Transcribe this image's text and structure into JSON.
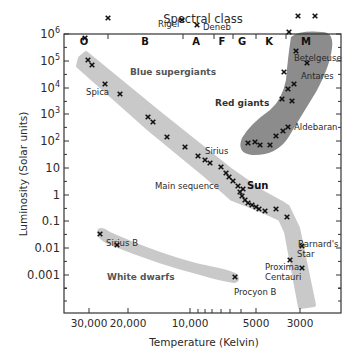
{
  "chart_data": {
    "type": "scatter",
    "title": "Spectral class",
    "xlabel": "Temperature (Kelvin)",
    "ylabel": "Luminosity (Solar units)",
    "x_scale": "log, reversed",
    "y_scale": "log",
    "x_tick_labels": [
      "30,000",
      "20,000",
      "10,000",
      "5000",
      "3000"
    ],
    "y_tick_labels": [
      "10^6",
      "10^5",
      "10^4",
      "10^3",
      "10^2",
      "10",
      "1",
      "0.1",
      "0.01",
      "0.001"
    ],
    "ylim": [
      0.0001,
      1000000
    ],
    "spectral_classes": [
      "O",
      "B",
      "A",
      "F",
      "G",
      "K",
      "M"
    ],
    "regions": [
      {
        "name": "Blue supergiants"
      },
      {
        "name": "Red giants"
      },
      {
        "name": "Main sequence"
      },
      {
        "name": "White dwarfs"
      }
    ],
    "labeled_stars": [
      {
        "name": "Rigel",
        "temperature": 11000,
        "luminosity": 200000
      },
      {
        "name": "Deneb",
        "temperature": 9000,
        "luminosity": 150000
      },
      {
        "name": "Betelgeuse",
        "temperature": 3500,
        "luminosity": 100000
      },
      {
        "name": "Antares",
        "temperature": 3300,
        "luminosity": 40000
      },
      {
        "name": "Spica",
        "temperature": 22000,
        "luminosity": 13000
      },
      {
        "name": "Aldebaran",
        "temperature": 4000,
        "luminosity": 150
      },
      {
        "name": "Sirius",
        "temperature": 9500,
        "luminosity": 25
      },
      {
        "name": "Sun",
        "temperature": 5800,
        "luminosity": 1
      },
      {
        "name": "Sirius B",
        "temperature": 25000,
        "luminosity": 0.03
      },
      {
        "name": "Procyon B",
        "temperature": 7000,
        "luminosity": 0.0007
      },
      {
        "name": "Barnard's Star",
        "temperature": 3200,
        "luminosity": 0.004
      },
      {
        "name": "Proxima Centauri",
        "temperature": 3000,
        "luminosity": 0.0017
      }
    ]
  },
  "header": {
    "title": "Spectral class"
  },
  "axes": {
    "xlabel": "Temperature (Kelvin)",
    "ylabel": "Luminosity (Solar units)",
    "x_ticks": [
      {
        "label": "30,000",
        "x": 89
      },
      {
        "label": "20,000",
        "x": 128
      },
      {
        "label": "10,000",
        "x": 190
      },
      {
        "label": "5000",
        "x": 256
      },
      {
        "label": "3000",
        "x": 300
      }
    ],
    "y_ticks": [
      {
        "base": "10",
        "exp": "6",
        "y": 34
      },
      {
        "base": "10",
        "exp": "5",
        "y": 61
      },
      {
        "base": "10",
        "exp": "4",
        "y": 88
      },
      {
        "base": "10",
        "exp": "3",
        "y": 114
      },
      {
        "base": "10",
        "exp": "2",
        "y": 141
      },
      {
        "label": "10",
        "y": 168
      },
      {
        "label": "1",
        "y": 195
      },
      {
        "label": "0.1",
        "y": 221
      },
      {
        "label": "0.01",
        "y": 248
      },
      {
        "label": "0.001",
        "y": 275
      }
    ]
  },
  "classes": [
    {
      "label": "O",
      "x": 84
    },
    {
      "label": "B",
      "x": 145
    },
    {
      "label": "A",
      "x": 196
    },
    {
      "label": "F",
      "x": 222
    },
    {
      "label": "G",
      "x": 242
    },
    {
      "label": "K",
      "x": 269
    },
    {
      "label": "M",
      "x": 306
    }
  ],
  "regions": {
    "blue_supergiants": "Blue supergiants",
    "red_giants": "Red giants",
    "main_sequence": "Main sequence",
    "white_dwarfs": "White dwarfs"
  },
  "stars": {
    "rigel": "Rigel",
    "deneb": "Deneb",
    "betelgeuse": "Betelgeuse",
    "antares": "Antares",
    "spica": "Spica",
    "aldebaran": "Aldebaran",
    "sirius": "Sirius",
    "sun": "Sun",
    "sirius_b": "Sirius B",
    "procyon_b": "Procyon B",
    "barnards_1": "Barnard's",
    "barnards_2": "Star",
    "proxima_1": "Proxima",
    "proxima_2": "Centauri"
  },
  "markers": [
    [
      85,
      38
    ],
    [
      108,
      18
    ],
    [
      88,
      60
    ],
    [
      92,
      65
    ],
    [
      105,
      84
    ],
    [
      120,
      94
    ],
    [
      148,
      117
    ],
    [
      153,
      122
    ],
    [
      167,
      137
    ],
    [
      185,
      147
    ],
    [
      198,
      156
    ],
    [
      205,
      160
    ],
    [
      210,
      163
    ],
    [
      221,
      167
    ],
    [
      226,
      173
    ],
    [
      229,
      177
    ],
    [
      233,
      181
    ],
    [
      238,
      186
    ],
    [
      243,
      189
    ],
    [
      240,
      192
    ],
    [
      242,
      196
    ],
    [
      245,
      200
    ],
    [
      248,
      203
    ],
    [
      252,
      205
    ],
    [
      256,
      207
    ],
    [
      259,
      209
    ],
    [
      265,
      211
    ],
    [
      276,
      209
    ],
    [
      287,
      217
    ],
    [
      182,
      20
    ],
    [
      197,
      25
    ],
    [
      298,
      16
    ],
    [
      315,
      16
    ],
    [
      289,
      32
    ],
    [
      296,
      51
    ],
    [
      307,
      63
    ],
    [
      284,
      72
    ],
    [
      282,
      99
    ],
    [
      288,
      89
    ],
    [
      294,
      84
    ],
    [
      292,
      101
    ],
    [
      248,
      143
    ],
    [
      255,
      142
    ],
    [
      260,
      145
    ],
    [
      270,
      145
    ],
    [
      276,
      136
    ],
    [
      283,
      131
    ],
    [
      288,
      127
    ],
    [
      290,
      260
    ],
    [
      302,
      268
    ],
    [
      302,
      246
    ],
    [
      100,
      234
    ],
    [
      117,
      245
    ],
    [
      235,
      277
    ]
  ],
  "colors": {
    "band": "#c8c8c8",
    "giants": "#8a8a8a",
    "axis": "#333333",
    "text": "#2a2a2a"
  }
}
